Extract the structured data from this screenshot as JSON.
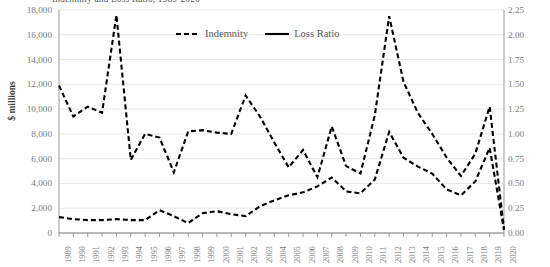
{
  "chart_data": {
    "type": "line",
    "title": "Indemnity and Loss Ratio, 1989-2020",
    "xlabel": "",
    "ylabel": "$ millions",
    "y2label": "",
    "ylim": [
      0,
      18000
    ],
    "y2lim": [
      0,
      2.25
    ],
    "grid": true,
    "legend_position": "top-center",
    "x": [
      "1989",
      "1990",
      "1991",
      "1992",
      "1993",
      "1994",
      "1995",
      "1996",
      "1997",
      "1998",
      "1999",
      "2000",
      "2001",
      "2002",
      "2003",
      "2004",
      "2005",
      "2006",
      "2007",
      "2008",
      "2009",
      "2010",
      "2011",
      "2012",
      "2013",
      "2014",
      "2015",
      "2016",
      "2017",
      "2018",
      "2019",
      "2020"
    ],
    "y_ticks_left": [
      "0",
      "2,000",
      "4,000",
      "6,000",
      "8,000",
      "10,000",
      "12,000",
      "14,000",
      "16,000",
      "18,000"
    ],
    "y_tick_values_left": [
      0,
      2000,
      4000,
      6000,
      8000,
      10000,
      12000,
      14000,
      16000,
      18000
    ],
    "y_ticks_right": [
      "0.00",
      "0.25",
      "0.50",
      "0.75",
      "1.00",
      "1.25",
      "1.50",
      "1.75",
      "2.00",
      "2.25"
    ],
    "y_tick_values_right": [
      0,
      0.25,
      0.5,
      0.75,
      1.0,
      1.25,
      1.5,
      1.75,
      2.0,
      2.25
    ],
    "series": [
      {
        "name": "Indemnity",
        "axis": "left",
        "style": "dashed",
        "color": "#000000",
        "values": [
          11900,
          9400,
          10200,
          9700,
          17600,
          5900,
          8000,
          7700,
          4900,
          8200,
          8300,
          8100,
          8000,
          11100,
          9400,
          7300,
          5300,
          6700,
          4500,
          8600,
          5400,
          4800,
          9500,
          17500,
          12200,
          9700,
          8000,
          6100,
          4600,
          6400,
          10200,
          300
        ]
      },
      {
        "name": "Loss Ratio",
        "axis": "right",
        "style": "solid",
        "color": "#000000",
        "values": [
          0.16,
          0.14,
          0.13,
          0.13,
          0.14,
          0.13,
          0.13,
          0.23,
          0.17,
          0.1,
          0.2,
          0.22,
          0.19,
          0.17,
          0.27,
          0.33,
          0.38,
          0.41,
          0.47,
          0.56,
          0.42,
          0.4,
          0.54,
          1.02,
          0.76,
          0.67,
          0.6,
          0.44,
          0.38,
          0.52,
          0.86,
          0.03
        ]
      }
    ]
  },
  "legend": {
    "items": [
      {
        "label": "Indemnity",
        "style": "dashed"
      },
      {
        "label": "Loss Ratio",
        "style": "solid"
      }
    ]
  }
}
